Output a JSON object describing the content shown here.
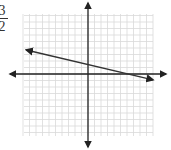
{
  "fraction": {
    "numerator": "3",
    "denominator": "2"
  },
  "chart_data": {
    "type": "line",
    "title": "",
    "xlabel": "",
    "ylabel": "",
    "grid": true,
    "xlim": [
      -10,
      10
    ],
    "ylim": [
      -10,
      10
    ],
    "axes_arrows": true,
    "series": [
      {
        "name": "line",
        "x": [
          -9.5,
          10
        ],
        "y": [
          3.7,
          -0.9
        ],
        "arrows": "both",
        "slope_approx": -0.25,
        "y_intercept_approx": 1.5
      }
    ]
  },
  "colors": {
    "grid": "#d9d9d9",
    "axis": "#222222",
    "line": "#333333"
  }
}
